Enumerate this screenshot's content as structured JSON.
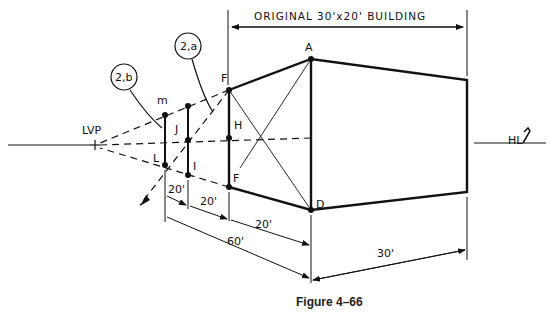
{
  "figure": {
    "caption": "Figure 4–66",
    "title_dimension": "ORIGINAL 30'x20' BUILDING"
  },
  "labels": {
    "lvp": "LVP",
    "hl": "HL",
    "a": "A",
    "d": "D",
    "f_top": "F",
    "f_bottom": "F",
    "h": "H",
    "j": "J",
    "i": "I",
    "l": "L",
    "m": "m",
    "callout_2a": "2,a",
    "callout_2b": "2,b"
  },
  "dimensions": {
    "seg1": "20'",
    "seg2": "20'",
    "seg3": "20'",
    "total": "60'",
    "width": "30'"
  },
  "colors": {
    "ink": "#111111",
    "background": "#ffffff"
  }
}
